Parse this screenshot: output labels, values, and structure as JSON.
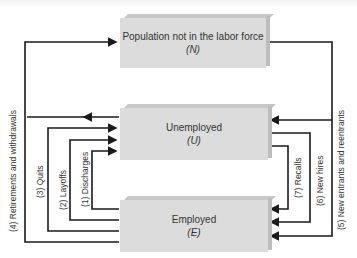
{
  "diagram": {
    "boxes": {
      "not_in_labor_force": {
        "label": "Population not in the labor force",
        "symbol": "(N)"
      },
      "unemployed": {
        "label": "Unemployed",
        "symbol": "(U)"
      },
      "employed": {
        "label": "Employed",
        "symbol": "(E)"
      }
    },
    "flows": [
      {
        "id": 1,
        "label": "(1) Discharges",
        "from": "employed",
        "to": "unemployed"
      },
      {
        "id": 2,
        "label": "(2) Layoffs",
        "from": "employed",
        "to": "unemployed"
      },
      {
        "id": 3,
        "label": "(3) Quits",
        "from": "employed",
        "to": "unemployed"
      },
      {
        "id": 4,
        "label": "(4) Retirements and withdrawals",
        "from": "employed/unemployed",
        "to": "not_in_labor_force"
      },
      {
        "id": 5,
        "label": "(5) New entrants and reentrants",
        "from": "not_in_labor_force",
        "to": "unemployed/employed"
      },
      {
        "id": 6,
        "label": "(6) New hires",
        "from": "unemployed",
        "to": "employed"
      },
      {
        "id": 7,
        "label": "(7) Recalls",
        "from": "unemployed",
        "to": "employed"
      }
    ],
    "colors": {
      "box_fill": "#dcdcdc",
      "line": "#1a1a1a",
      "text": "#333333"
    }
  }
}
